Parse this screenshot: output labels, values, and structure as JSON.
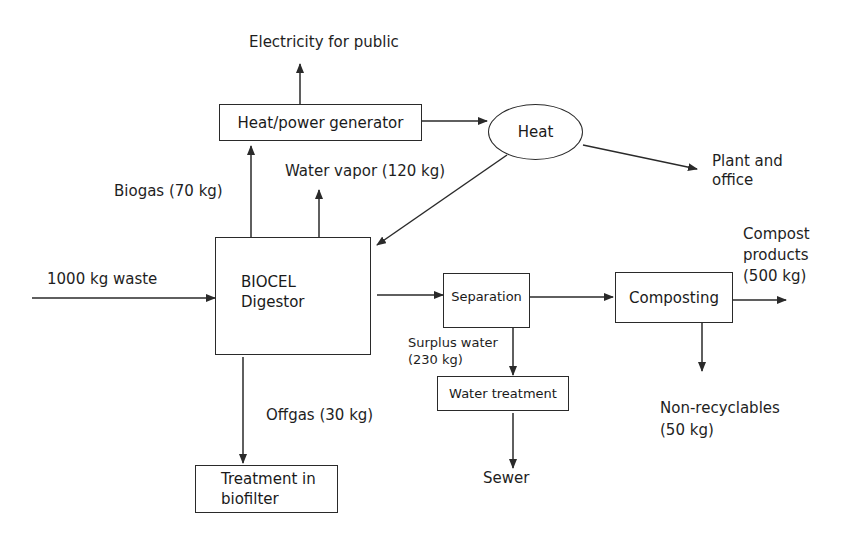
{
  "diagram": {
    "nodes": {
      "heat_power_generator": "Heat/power generator",
      "heat": "Heat",
      "digestor_line1": "BIOCEL",
      "digestor_line2": "Digestor",
      "separation": "Separation",
      "water_treatment": "Water treatment",
      "composting": "Composting",
      "biofilter_line1": "Treatment in",
      "biofilter_line2": "biofilter"
    },
    "flows": {
      "electricity": "Electricity for public",
      "plant_office_line1": "Plant and",
      "plant_office_line2": "office",
      "biogas": "Biogas (70 kg)",
      "water_vapor": "Water vapor (120 kg)",
      "waste_input": "1000 kg waste",
      "surplus_water_line1": "Surplus water",
      "surplus_water_line2": "(230 kg)",
      "offgas": "Offgas (30 kg)",
      "sewer": "Sewer",
      "compost_line1": "Compost",
      "compost_line2": "products",
      "compost_line3": "(500 kg)",
      "nonrecyclables_line1": "Non-recyclables",
      "nonrecyclables_line2": "(50 kg)"
    },
    "colors": {
      "line": "#2a2a2a",
      "background": "#ffffff",
      "text": "#1e1e1e"
    }
  }
}
